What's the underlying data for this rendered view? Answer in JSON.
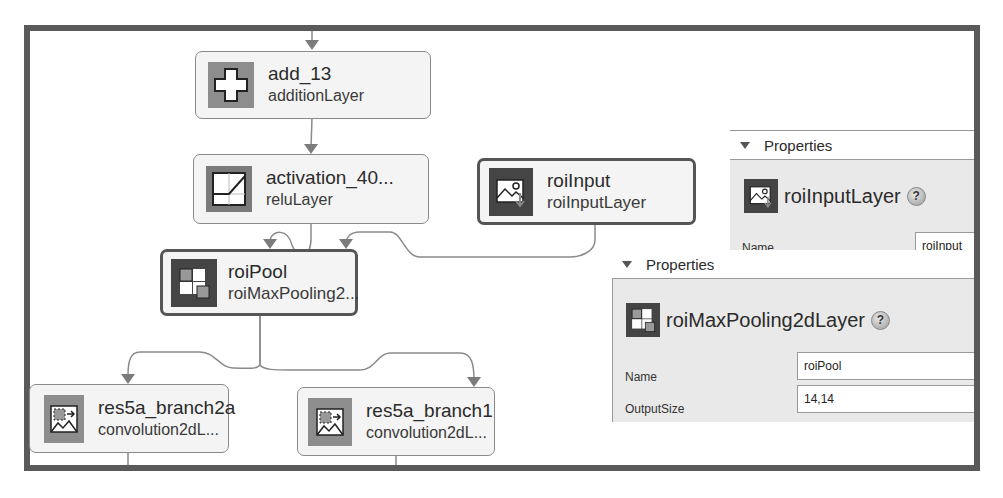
{
  "graph": {
    "nodes": [
      {
        "id": "add_13",
        "title": "add_13",
        "type": "additionLayer",
        "icon": "addition-icon"
      },
      {
        "id": "activation_40",
        "title": "activation_40...",
        "type": "reluLayer",
        "icon": "relu-icon"
      },
      {
        "id": "roiInput",
        "title": "roiInput",
        "type": "roiInputLayer",
        "icon": "roi-input-icon",
        "selected": true
      },
      {
        "id": "roiPool",
        "title": "roiPool",
        "type": "roiMaxPooling2...",
        "icon": "roi-max-pooling-icon",
        "selected": true
      },
      {
        "id": "res5a_branch2a",
        "title": "res5a_branch2a",
        "type": "convolution2dL...",
        "icon": "convolution-icon"
      },
      {
        "id": "res5a_branch1",
        "title": "res5a_branch1",
        "type": "convolution2dL...",
        "icon": "convolution-icon"
      }
    ]
  },
  "panels": {
    "roiInput_props": {
      "header": "Properties",
      "layer_type": "roiInputLayer",
      "help": "?",
      "fields": [
        {
          "label": "Name",
          "value": "roiInput"
        }
      ]
    },
    "roiPool_props": {
      "header": "Properties",
      "layer_type": "roiMaxPooling2dLayer",
      "help": "?",
      "fields": [
        {
          "label": "Name",
          "value": "roiPool"
        },
        {
          "label": "OutputSize",
          "value": "14,14"
        }
      ]
    }
  },
  "colors": {
    "frame": "#5a5a5a",
    "node_bg": "#f4f4f4",
    "panel_bg": "#e9e9e9",
    "wire": "#8a8a8a"
  }
}
